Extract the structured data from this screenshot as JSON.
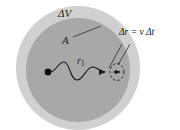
{
  "figure": {
    "background_color": "#ffffff",
    "width": 180,
    "height": 130
  },
  "colors": {
    "outer_shell_fill": "#d0d0d0",
    "inner_sphere_fill": "#a8a8a8",
    "stroke": "#1a1a1a",
    "label_text": "#1a1a1a",
    "dashed_marker": "#1a1a1a"
  },
  "shapes": {
    "outer_circle": {
      "cx": 78,
      "cy": 68,
      "r": 62,
      "label": "delta-V-shell"
    },
    "inner_circle": {
      "cx": 78,
      "cy": 70,
      "r": 52,
      "label": "sphere-of-radius-r1"
    },
    "center_dot": {
      "cx": 48,
      "cy": 72,
      "r": 3.4
    },
    "dashed_ellipse": {
      "cx": 117,
      "cy": 72,
      "rx": 7,
      "ry": 8.5
    }
  },
  "labels": {
    "delta_volume": "ΔV",
    "area": "A",
    "radius": "r",
    "radius_subscript": "1",
    "displacement": "Δr = v Δt"
  },
  "annotations": {
    "leader_A": {
      "from_x": 72,
      "from_y": 36,
      "to_x": 101,
      "to_y": 26
    },
    "leader_deltar_left": {
      "from_x": 122,
      "from_y": 44,
      "to_x": 110,
      "to_y": 68
    },
    "leader_deltar_right": {
      "from_x": 129,
      "from_y": 44,
      "to_x": 117,
      "to_y": 66
    }
  },
  "paths": {
    "wavy_trajectory": "M 50 72 C 56 72 58 62 64 62 C 70 62 70 80 77 80 C 84 80 86 66 93 67 C 99 68 101 72 106 72",
    "wavy_description": "particle-path-from-center-to-surface"
  }
}
